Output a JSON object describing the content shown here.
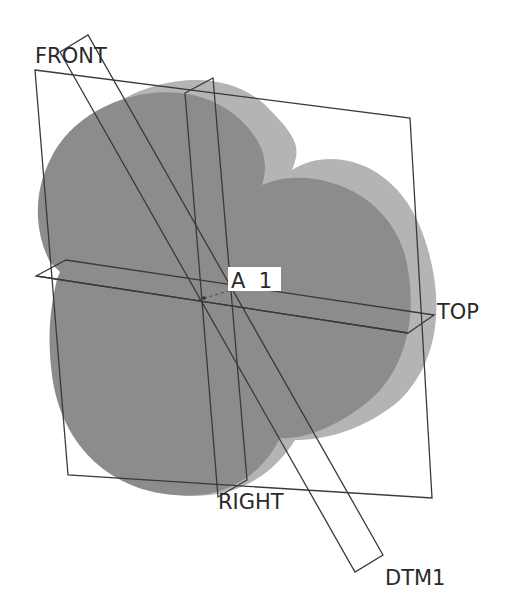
{
  "scene": {
    "title": "3D model with datum planes",
    "colors": {
      "background": "#ffffff",
      "front_face": "#8c8c8c",
      "side_face": "#b4b4b4",
      "plane_edge": "#3a3a3a",
      "label_text": "#2a2a2a",
      "axis_label_bg": "#ffffff"
    }
  },
  "datum_planes": [
    {
      "id": "front",
      "label": "FRONT"
    },
    {
      "id": "top",
      "label": "TOP"
    },
    {
      "id": "right",
      "label": "RIGHT"
    },
    {
      "id": "dtm1",
      "label": "DTM1"
    }
  ],
  "datum_axes": [
    {
      "id": "a1",
      "label": "A_1",
      "display_label": "A  1"
    }
  ],
  "model": {
    "name": "four-lobe-extrusion",
    "shading": "shaded"
  }
}
